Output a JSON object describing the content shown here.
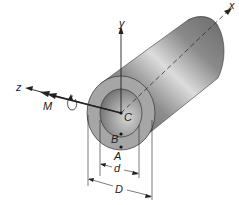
{
  "diagram": {
    "labels": {
      "axis_x": "x",
      "axis_y": "y",
      "axis_z": "z",
      "moment": "M",
      "center": "C",
      "point_b": "B",
      "point_a": "A",
      "inner_diameter": "d",
      "outer_diameter": "D"
    },
    "colors": {
      "tube_dark": "#6e6e6e",
      "tube_mid": "#9a9a9a",
      "tube_light": "#d8d8d8",
      "end_face": "#a9a9a9",
      "inner_hole": "#8c8c8c",
      "line": "#222222"
    }
  }
}
